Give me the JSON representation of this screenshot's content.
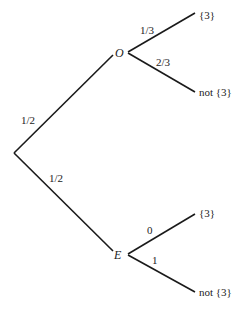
{
  "diagram": {
    "type": "probability-tree",
    "root": {
      "x": 14,
      "y": 153
    },
    "nodes": [
      {
        "id": "O",
        "label": "O",
        "x": 127,
        "y": 52
      },
      {
        "id": "E",
        "label": "E",
        "x": 127,
        "y": 254
      }
    ],
    "edges": [
      {
        "from": "root",
        "to": "O",
        "prob": "1/2"
      },
      {
        "from": "root",
        "to": "E",
        "prob": "1/2"
      },
      {
        "from": "O",
        "to": "O_top",
        "prob": "1/3"
      },
      {
        "from": "O",
        "to": "O_bot",
        "prob": "2/3"
      },
      {
        "from": "E",
        "to": "E_top",
        "prob": "0"
      },
      {
        "from": "E",
        "to": "E_bot",
        "prob": "1"
      }
    ],
    "leaves": {
      "o_top": "{3}",
      "o_bot": "not {3}",
      "e_top": "{3}",
      "e_bot": "not {3}"
    },
    "colors": {
      "line": "#1a1a1a",
      "text": "#222222",
      "background": "#ffffff"
    }
  }
}
